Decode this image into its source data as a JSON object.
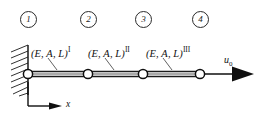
{
  "figure": {
    "background_color": "#ffffff",
    "line_color": "#1a1a1a",
    "node_fill_color": "#ffffff"
  },
  "nodes": [
    {
      "id": "1",
      "label": "1",
      "badge_x": 20,
      "badge_y": 11,
      "point_x": 28,
      "point_y": 74
    },
    {
      "id": "2",
      "label": "2",
      "badge_x": 80,
      "badge_y": 11,
      "point_x": 88,
      "point_y": 74
    },
    {
      "id": "3",
      "label": "3",
      "badge_x": 135,
      "badge_y": 11,
      "point_x": 143,
      "point_y": 74
    },
    {
      "id": "4",
      "label": "4",
      "badge_x": 192,
      "badge_y": 11,
      "point_x": 200,
      "point_y": 74
    }
  ],
  "elements": [
    {
      "id": "I",
      "base_text": "(E, A, L)",
      "superscript": "I",
      "label_x": 31,
      "label_y": 45,
      "leader": {
        "x1": 48,
        "y1": 58,
        "x2": 57,
        "y2": 71
      }
    },
    {
      "id": "II",
      "base_text": "(E, A, L)",
      "superscript": "II",
      "label_x": 88,
      "label_y": 45,
      "leader": {
        "x1": 105,
        "y1": 58,
        "x2": 114,
        "y2": 71
      }
    },
    {
      "id": "III",
      "base_text": "(E, A, L)",
      "superscript": "III",
      "label_x": 146,
      "label_y": 45,
      "leader": {
        "x1": 163,
        "y1": 58,
        "x2": 172,
        "y2": 71
      }
    }
  ],
  "support": {
    "type": "fixed-wall",
    "wall_x": 28,
    "wall_top": 45,
    "wall_bottom": 95,
    "hatch_count": 9
  },
  "axis": {
    "label": "x",
    "label_x": 66,
    "label_y": 100,
    "origin_x": 28,
    "origin_y": 106,
    "arrow_end_x": 60,
    "vertical_top": 82
  },
  "load": {
    "label_base": "u",
    "label_sub": "0",
    "label_x": 224,
    "label_y": 55,
    "arrow_start_x": 200,
    "arrow_end_x": 252,
    "arrow_y": 74
  }
}
